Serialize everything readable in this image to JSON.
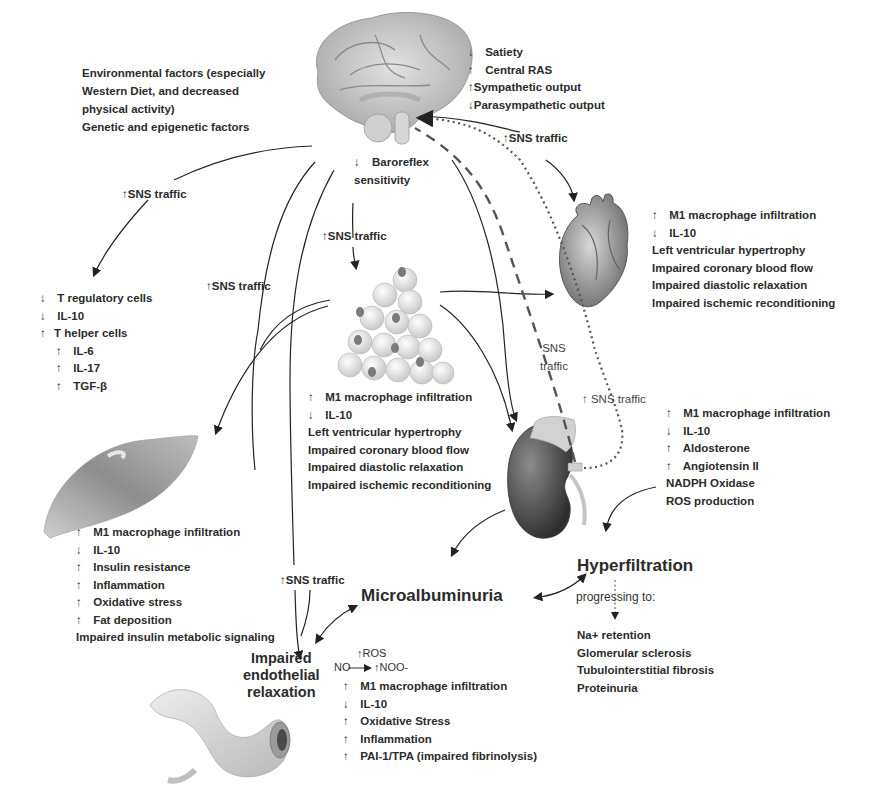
{
  "arrow_glyphs": {
    "up": "↑",
    "down": "↓"
  },
  "environment": {
    "lines": [
      "Environmental factors (especially",
      "Western Diet, and decreased",
      "physical activity)",
      "Genetic and epigenetic factors"
    ]
  },
  "brain": {
    "effects": [
      {
        "dir": "↓",
        "text": " Satiety"
      },
      {
        "dir": "↑",
        "text": " Central RAS"
      },
      {
        "dir": "↑",
        "text": "Sympathetic output"
      },
      {
        "dir": "↓",
        "text": "Parasympathetic output"
      }
    ],
    "baroreflex": {
      "dir": "↓",
      "line1": "Baroreflex",
      "line2": "sensitivity"
    }
  },
  "sns_labels": {
    "to_heart": "↑SNS traffic",
    "to_immune": "↑SNS traffic",
    "to_adipose": "↑SNS traffic",
    "to_muscle": "↑SNS traffic",
    "to_vessel": "↑SNS traffic",
    "kidney_afferent_1": "SNS",
    "kidney_afferent_2": "traffic",
    "kidney_efferent": "↑ SNS traffic"
  },
  "heart": {
    "effects": [
      {
        "dir": "↑",
        "text": "M1 macrophage infiltration"
      },
      {
        "dir": "↓",
        "text": "IL-10"
      },
      {
        "dir": "",
        "text": "Left ventricular hypertrophy"
      },
      {
        "dir": "",
        "text": "Impaired coronary blood flow"
      },
      {
        "dir": "",
        "text": "Impaired diastolic relaxation"
      },
      {
        "dir": "",
        "text": "Impaired ischemic reconditioning"
      }
    ]
  },
  "immune": {
    "effects": [
      {
        "dir": "↓",
        "text": "T regulatory cells",
        "indent": false
      },
      {
        "dir": "↓",
        "text": "IL-10",
        "indent": false
      },
      {
        "dir": "↑",
        "text": "T helper cells",
        "indent": false
      },
      {
        "dir": "↑",
        "text": "IL-6",
        "indent": true
      },
      {
        "dir": "↑",
        "text": "IL-17",
        "indent": true
      },
      {
        "dir": "↑",
        "text": "TGF-β",
        "indent": true
      }
    ]
  },
  "adipose": {
    "effects": [
      {
        "dir": "↑",
        "text": "M1 macrophage infiltration"
      },
      {
        "dir": "↓",
        "text": "IL-10"
      },
      {
        "dir": "",
        "text": "Left ventricular hypertrophy"
      },
      {
        "dir": "",
        "text": "Impaired coronary blood flow"
      },
      {
        "dir": "",
        "text": "Impaired diastolic relaxation"
      },
      {
        "dir": "",
        "text": "Impaired ischemic reconditioning"
      }
    ]
  },
  "kidney": {
    "effects": [
      {
        "dir": "↑",
        "text": "M1 macrophage infiltration"
      },
      {
        "dir": "↓",
        "text": "IL-10"
      },
      {
        "dir": "↑",
        "text": "Aldosterone"
      },
      {
        "dir": "↑",
        "text": "Angiotensin II"
      },
      {
        "dir": "",
        "text": "NADPH Oxidase"
      },
      {
        "dir": "",
        "text": "ROS production"
      }
    ]
  },
  "muscle": {
    "effects": [
      {
        "dir": "↑",
        "text": "M1 macrophage infiltration"
      },
      {
        "dir": "↓",
        "text": "IL-10"
      },
      {
        "dir": "↑",
        "text": "Insulin resistance"
      },
      {
        "dir": "↑",
        "text": "Inflammation"
      },
      {
        "dir": "↑",
        "text": "Oxidative stress"
      },
      {
        "dir": "↑",
        "text": "Fat deposition"
      },
      {
        "dir": "",
        "text": "Impaired insulin metabolic signaling"
      }
    ]
  },
  "outcomes": {
    "hyperfiltration": "Hyperfiltration",
    "microalbuminuria": "Microalbuminuria",
    "progressing": "progressing to:",
    "progression_list": [
      "Na+ retention",
      "Glomerular sclerosis",
      "Tubulointerstitial fibrosis",
      "Proteinuria"
    ]
  },
  "vessel": {
    "title": [
      "Impaired",
      "endothelial",
      "relaxation"
    ],
    "reaction": {
      "reactant": "NO",
      "catalyst": "ROS",
      "product": "NOO-"
    },
    "effects": [
      {
        "dir": "↑",
        "text": "M1 macrophage infiltration"
      },
      {
        "dir": "↓",
        "text": "IL-10"
      },
      {
        "dir": "↑",
        "text": "Oxidative Stress"
      },
      {
        "dir": "↑",
        "text": "Inflammation"
      },
      {
        "dir": "↑",
        "text": "PAI-1/TPA (impaired fibrinolysis)"
      }
    ]
  }
}
